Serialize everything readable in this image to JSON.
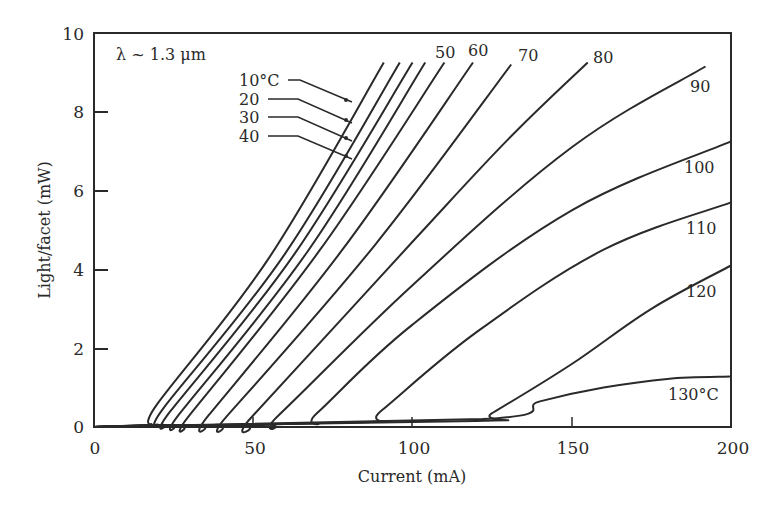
{
  "chart_data": {
    "type": "line",
    "title": "",
    "annotation": "λ ~ 1.3 μm",
    "xlabel": "Current (mA)",
    "ylabel": "Light/facet (mW)",
    "xlim": [
      0,
      200
    ],
    "ylim": [
      0,
      10
    ],
    "xticks": [
      0,
      50,
      100,
      150,
      200
    ],
    "yticks": [
      0,
      2,
      4,
      6,
      8,
      10
    ],
    "grid": false,
    "legend": "inline labels at curve ends",
    "series": [
      {
        "name": "10°C",
        "label": "10°C",
        "points": [
          [
            0,
            0
          ],
          [
            17,
            0.05
          ],
          [
            20,
            0.6
          ],
          [
            55,
            4.3
          ],
          [
            91,
            9.25
          ]
        ]
      },
      {
        "name": "20°C",
        "label": "20",
        "points": [
          [
            0,
            0
          ],
          [
            19,
            0.05
          ],
          [
            22,
            0.5
          ],
          [
            60,
            4.4
          ],
          [
            96,
            9.25
          ]
        ]
      },
      {
        "name": "30°C",
        "label": "30",
        "points": [
          [
            0,
            0
          ],
          [
            21,
            0.05
          ],
          [
            24,
            0.4
          ],
          [
            63,
            4.4
          ],
          [
            100,
            9.25
          ]
        ]
      },
      {
        "name": "40°C",
        "label": "40",
        "points": [
          [
            0,
            0
          ],
          [
            24,
            0.05
          ],
          [
            27,
            0.35
          ],
          [
            67,
            4.45
          ],
          [
            104,
            9.25
          ]
        ]
      },
      {
        "name": "50°C",
        "label": "50",
        "points": [
          [
            0,
            0
          ],
          [
            27,
            0.05
          ],
          [
            30,
            0.3
          ],
          [
            71,
            4.5
          ],
          [
            110,
            9.25
          ]
        ]
      },
      {
        "name": "60°C",
        "label": "60",
        "points": [
          [
            0,
            0
          ],
          [
            33,
            0.05
          ],
          [
            36,
            0.3
          ],
          [
            78,
            4.5
          ],
          [
            119,
            9.25
          ]
        ]
      },
      {
        "name": "70°C",
        "label": "70",
        "points": [
          [
            0,
            0
          ],
          [
            38,
            0.05
          ],
          [
            42,
            0.3
          ],
          [
            88,
            4.6
          ],
          [
            131,
            9.2
          ]
        ]
      },
      {
        "name": "80°C",
        "label": "80",
        "points": [
          [
            0,
            0
          ],
          [
            46,
            0.05
          ],
          [
            50,
            0.3
          ],
          [
            100,
            4.7
          ],
          [
            130,
            7.3
          ],
          [
            155,
            9.25
          ]
        ]
      },
      {
        "name": "90°C",
        "label": "90",
        "points": [
          [
            0,
            0
          ],
          [
            53,
            0.05
          ],
          [
            58,
            0.3
          ],
          [
            100,
            3.6
          ],
          [
            150,
            7.1
          ],
          [
            192,
            9.15
          ]
        ]
      },
      {
        "name": "100°C",
        "label": "100",
        "points": [
          [
            0,
            0
          ],
          [
            65,
            0.08
          ],
          [
            70,
            0.35
          ],
          [
            100,
            2.6
          ],
          [
            150,
            5.5
          ],
          [
            200,
            7.25
          ]
        ]
      },
      {
        "name": "110°C",
        "label": "110",
        "points": [
          [
            0,
            0
          ],
          [
            85,
            0.12
          ],
          [
            90,
            0.4
          ],
          [
            120,
            2.4
          ],
          [
            160,
            4.5
          ],
          [
            200,
            5.7
          ]
        ]
      },
      {
        "name": "120°C",
        "label": "120",
        "points": [
          [
            0,
            0
          ],
          [
            120,
            0.15
          ],
          [
            125,
            0.35
          ],
          [
            150,
            1.6
          ],
          [
            175,
            3.0
          ],
          [
            200,
            4.1
          ]
        ]
      },
      {
        "name": "130°C",
        "label": "130°C",
        "points": [
          [
            0,
            0
          ],
          [
            122,
            0.2
          ],
          [
            140,
            0.65
          ],
          [
            160,
            1.0
          ],
          [
            180,
            1.22
          ],
          [
            200,
            1.28
          ]
        ]
      }
    ],
    "pointer_labels": [
      "10°C",
      "20",
      "30",
      "40"
    ]
  },
  "axes": {
    "x_title": "Current (mA)",
    "y_title": "Light/facet (mW)",
    "x_ticks": [
      "0",
      "50",
      "100",
      "150",
      "200"
    ],
    "y_ticks": [
      "0",
      "2",
      "4",
      "6",
      "8",
      "10"
    ]
  },
  "annotation": "λ ~ 1.3 μm",
  "labels": {
    "l10": "10°C",
    "l20": "20",
    "l30": "30",
    "l40": "40",
    "l50": "50",
    "l60": "60",
    "l70": "70",
    "l80": "80",
    "l90": "90",
    "l100": "100",
    "l110": "110",
    "l120": "120",
    "l130": "130°C"
  },
  "colors": {
    "line": "#2a2a2a",
    "background": "#ffffff"
  }
}
